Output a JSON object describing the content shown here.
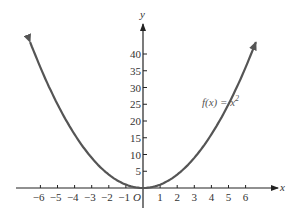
{
  "chart_data": {
    "type": "line",
    "title": "",
    "xlabel": "x",
    "ylabel": "y",
    "origin_label": "O",
    "xlim": [
      -7.5,
      7.8
    ],
    "ylim": [
      -8,
      50
    ],
    "grid": false,
    "legend": null,
    "x_ticks": [
      -6,
      -5,
      -4,
      -3,
      -2,
      -1,
      1,
      2,
      3,
      4,
      5,
      6
    ],
    "x_tick_labels": [
      "−6",
      "−5",
      "−4",
      "−3",
      "−2",
      "−1",
      "1",
      "2",
      "3",
      "4",
      "5",
      "6"
    ],
    "y_ticks": [
      5,
      10,
      15,
      20,
      25,
      30,
      35,
      40
    ],
    "y_tick_labels": [
      "5",
      "10",
      "15",
      "20",
      "25",
      "30",
      "35",
      "40"
    ],
    "annotations": [
      {
        "text": "f(x) = x²",
        "x": 4.2,
        "y": 22
      }
    ],
    "series": [
      {
        "name": "f(x) = x^2",
        "function": "x^2",
        "x": [
          -6.5,
          -6,
          -5,
          -4,
          -3,
          -2,
          -1,
          0,
          1,
          2,
          3,
          4,
          5,
          6,
          6.5
        ],
        "y": [
          42.25,
          36,
          25,
          16,
          9,
          4,
          1,
          0,
          1,
          4,
          9,
          16,
          25,
          36,
          42.25
        ],
        "arrows_at_ends": true
      }
    ]
  },
  "labels": {
    "x_axis": "x",
    "y_axis": "y",
    "origin": "O",
    "function_name": "f(x) = x",
    "function_exponent": "2"
  }
}
